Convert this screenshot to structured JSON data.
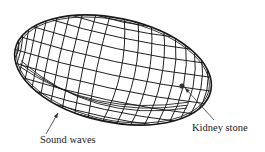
{
  "diagram": {
    "labels": {
      "sound_waves": "Sound waves",
      "kidney_stone": "Kidney stone"
    },
    "colors": {
      "line": "#1a1a1a",
      "background": "#ffffff",
      "stone": "#333333"
    },
    "ellipsoid": {
      "cx": 113,
      "cy": 70,
      "rx": 100,
      "ry": 52,
      "rotation_deg": 12,
      "meridians": 22,
      "parallels": 12
    },
    "stone_position": {
      "x": 182,
      "y": 86
    },
    "arrows": {
      "sound_waves": {
        "from": [
          46,
          134
        ],
        "to": [
          58,
          113
        ]
      },
      "kidney_stone": {
        "from": [
          214,
          120
        ],
        "to": [
          185,
          88
        ]
      }
    }
  }
}
